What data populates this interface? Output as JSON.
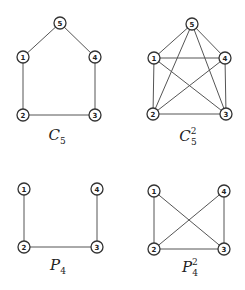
{
  "diagram": {
    "node_radius": 6,
    "colors": {
      "edge": "#555555",
      "node_stroke": "#333333",
      "node_fill": "#ffffff",
      "text": "#222222"
    },
    "graphs": [
      {
        "id": "c5",
        "caption": {
          "base": "C",
          "sub": "5",
          "sup": "",
          "x": 57,
          "y": 140
        },
        "nodes": [
          {
            "id": "1",
            "label": "1",
            "x": 23,
            "y": 57
          },
          {
            "id": "2",
            "label": "2",
            "x": 23,
            "y": 115
          },
          {
            "id": "3",
            "label": "3",
            "x": 95,
            "y": 115
          },
          {
            "id": "4",
            "label": "4",
            "x": 95,
            "y": 57
          },
          {
            "id": "5",
            "label": "5",
            "x": 60,
            "y": 23
          }
        ],
        "edges": [
          [
            "1",
            "5"
          ],
          [
            "5",
            "4"
          ],
          [
            "4",
            "3"
          ],
          [
            "3",
            "2"
          ],
          [
            "2",
            "1"
          ]
        ]
      },
      {
        "id": "c5-squared",
        "caption": {
          "base": "C",
          "sub": "5",
          "sup": "2",
          "x": 188,
          "y": 141
        },
        "nodes": [
          {
            "id": "1",
            "label": "1",
            "x": 154,
            "y": 58
          },
          {
            "id": "2",
            "label": "2",
            "x": 153,
            "y": 114
          },
          {
            "id": "3",
            "label": "3",
            "x": 226,
            "y": 114
          },
          {
            "id": "4",
            "label": "4",
            "x": 225,
            "y": 58
          },
          {
            "id": "5",
            "label": "5",
            "x": 192,
            "y": 24
          }
        ],
        "edges": [
          [
            "1",
            "5"
          ],
          [
            "5",
            "4"
          ],
          [
            "4",
            "3"
          ],
          [
            "3",
            "2"
          ],
          [
            "2",
            "1"
          ],
          [
            "1",
            "4"
          ],
          [
            "1",
            "3"
          ],
          [
            "2",
            "4"
          ],
          [
            "2",
            "5"
          ],
          [
            "3",
            "5"
          ]
        ]
      },
      {
        "id": "p4",
        "caption": {
          "base": "P",
          "sub": "4",
          "sup": "",
          "x": 58,
          "y": 270
        },
        "nodes": [
          {
            "id": "1",
            "label": "1",
            "x": 24,
            "y": 189
          },
          {
            "id": "2",
            "label": "2",
            "x": 24,
            "y": 247
          },
          {
            "id": "3",
            "label": "3",
            "x": 97,
            "y": 247
          },
          {
            "id": "4",
            "label": "4",
            "x": 97,
            "y": 189
          }
        ],
        "edges": [
          [
            "1",
            "2"
          ],
          [
            "2",
            "3"
          ],
          [
            "3",
            "4"
          ]
        ]
      },
      {
        "id": "p4-squared",
        "caption": {
          "base": "P",
          "sub": "4",
          "sup": "2",
          "x": 190,
          "y": 272
        },
        "nodes": [
          {
            "id": "1",
            "label": "1",
            "x": 154,
            "y": 191
          },
          {
            "id": "2",
            "label": "2",
            "x": 154,
            "y": 249
          },
          {
            "id": "3",
            "label": "3",
            "x": 224,
            "y": 249
          },
          {
            "id": "4",
            "label": "4",
            "x": 224,
            "y": 191
          }
        ],
        "edges": [
          [
            "1",
            "2"
          ],
          [
            "2",
            "3"
          ],
          [
            "3",
            "4"
          ],
          [
            "1",
            "3"
          ],
          [
            "2",
            "4"
          ]
        ]
      }
    ]
  }
}
